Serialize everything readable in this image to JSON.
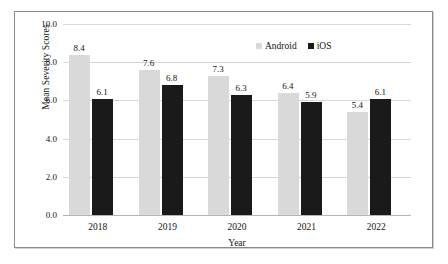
{
  "chart_data": {
    "type": "bar",
    "title": "",
    "xlabel": "Year",
    "ylabel": "Mean Severity Scores",
    "categories": [
      "2018",
      "2019",
      "2020",
      "2021",
      "2022"
    ],
    "series": [
      {
        "name": "Android",
        "color": "#d9d9d9",
        "values": [
          8.4,
          7.6,
          7.3,
          6.4,
          5.4
        ]
      },
      {
        "name": "iOS",
        "color": "#1a1a1a",
        "values": [
          6.1,
          6.8,
          6.3,
          5.9,
          6.1
        ]
      }
    ],
    "ylim": [
      0.0,
      10.0
    ],
    "ytick_labels": [
      "10.0",
      "8.0",
      "6.0",
      "4.0",
      "2.0",
      "0.0"
    ],
    "ytick_values": [
      10.0,
      8.0,
      6.0,
      4.0,
      2.0,
      0.0
    ],
    "grid": true,
    "legend_position": "top-right",
    "data_labels": true
  },
  "axes": {
    "y_title": "Mean Severity Scores",
    "x_title": "Year"
  },
  "legend": {
    "items": [
      {
        "label": "Android",
        "color": "#d9d9d9"
      },
      {
        "label": "iOS",
        "color": "#1a1a1a"
      }
    ]
  }
}
